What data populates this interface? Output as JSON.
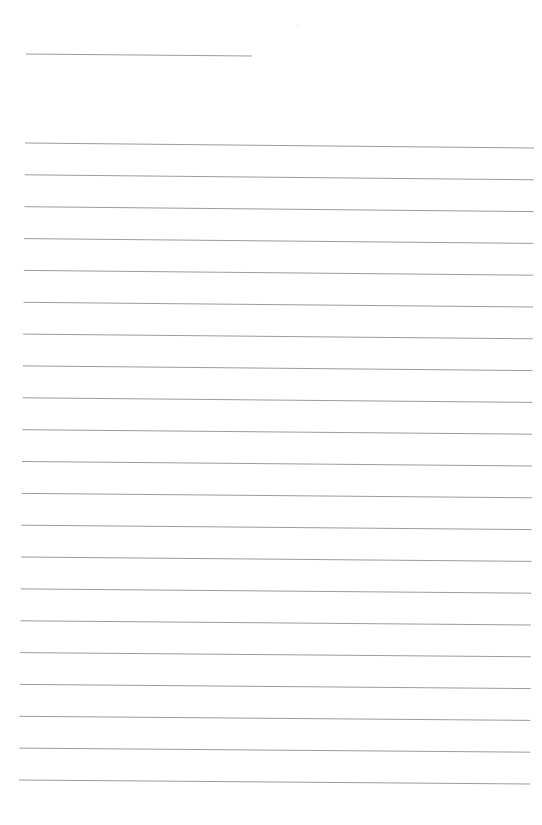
{
  "page": {
    "type": "lined-paper",
    "width": 542,
    "height": 825,
    "background_color": "#ffffff",
    "line_color": "#9c9c9c",
    "line_width": 1
  },
  "header_line": {
    "x1": 26,
    "y1": 54,
    "x2": 252,
    "y2": 56
  },
  "ruled_lines": {
    "count": 21,
    "first_left": {
      "x": 25,
      "y": 143
    },
    "first_right": {
      "x": 534,
      "y": 148
    },
    "last_left": {
      "x": 19,
      "y": 780
    },
    "last_right": {
      "x": 530,
      "y": 784
    },
    "spacing": 31.85
  },
  "marks": [
    {
      "x": 297,
      "y": 25
    }
  ]
}
